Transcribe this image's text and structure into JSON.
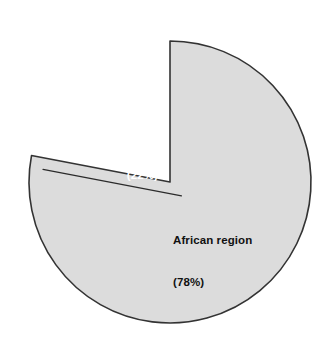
{
  "chart_data": {
    "type": "pie",
    "title": "",
    "categories": [
      "African region",
      "Rest of the world"
    ],
    "values": [
      78,
      22
    ],
    "units": "percent",
    "legend": "none",
    "labels_inside": true,
    "exploded_slices": [
      "Rest of the world"
    ],
    "start_angle_deg": 0,
    "direction": "clockwise",
    "slices": [
      {
        "name": "African region",
        "value": 78,
        "label_line1": "African region",
        "label_line2": "(78%)",
        "fill": "#dcdcdc",
        "stroke": "#333333",
        "text_color": "#111111",
        "exploded": false
      },
      {
        "name": "Rest of the world",
        "value": 22,
        "label_line1": "Rest of",
        "label_line2": "the world",
        "label_line3": "(22%)",
        "fill": "#2b2b2b",
        "stroke": "#2b2b2b",
        "text_color": "#ffffff",
        "exploded": true
      }
    ]
  },
  "figure": {
    "background": "#ffffff",
    "gray_fill": "#dcdcdc",
    "dark_fill": "#2b2b2b",
    "outline": "#333333"
  },
  "labels": {
    "african_line1": "African region",
    "african_line2": "(78%)",
    "rest_line1": "Rest of",
    "rest_line2": "the world",
    "rest_line3": "(22%)"
  }
}
